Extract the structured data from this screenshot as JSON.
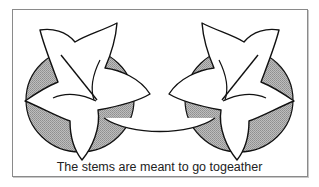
{
  "figure": {
    "caption": "The stems are meant to go togeather",
    "shading_color": "#a9a9a9",
    "outline_color": "#111111",
    "leaf_fill": "#ffffff",
    "elements": [
      {
        "name": "left-leaf",
        "shaded_ellipse": true
      },
      {
        "name": "right-leaf",
        "shaded_ellipse": true,
        "mirrored": true
      }
    ]
  }
}
